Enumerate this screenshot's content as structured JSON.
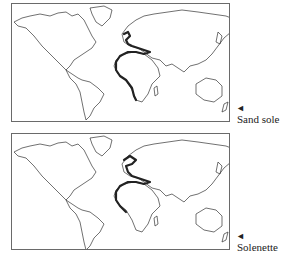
{
  "maps": [
    {
      "species": "Sand sole",
      "marker_icon": "left-pointing-triangle",
      "range_regions": [
        "North Sea",
        "British Isles",
        "Mediterranean Sea",
        "West Africa coast"
      ]
    },
    {
      "species": "Solenette",
      "marker_icon": "left-pointing-triangle",
      "range_regions": [
        "North Sea",
        "Baltic approaches",
        "British Isles",
        "Mediterranean Sea",
        "West Africa coast"
      ]
    }
  ],
  "colors": {
    "land_outline": "#333333",
    "range_highlight": "#222222",
    "background": "#ffffff"
  },
  "arrow_glyph": "◄"
}
